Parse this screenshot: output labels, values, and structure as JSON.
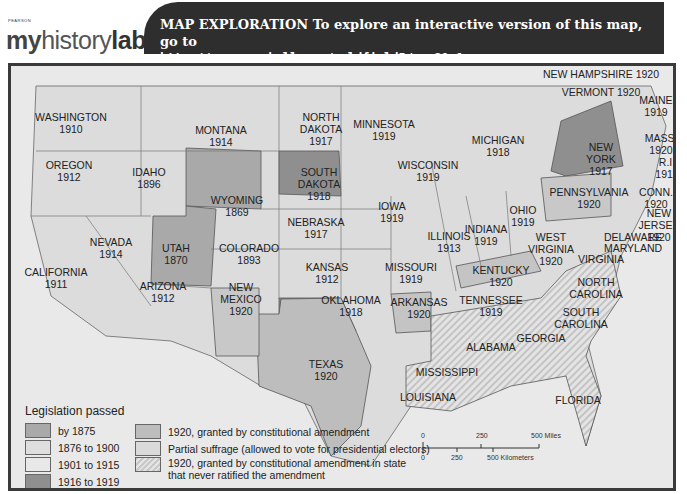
{
  "header": {
    "publisher": "PEARSON",
    "logo_text": [
      "my",
      "history",
      "lab"
    ],
    "banner_line1": "MAP EXPLORATION  To explore an interactive version of this map, go to",
    "banner_line2": "http://www.prenhall.com/goldfield5/map21.1"
  },
  "colors": {
    "by_1875": "#a9a9a9",
    "1876_1900": "#e0e0e0",
    "1901_1915": "#e6e6e6",
    "1916_1919": "#8f8f8f",
    "amendment_1920": "#bdbdbd",
    "partial": "#dadada",
    "water": "#ececec",
    "banner": "#2e2e2e"
  },
  "states": [
    {
      "name": "WASHINGTON",
      "year": "1910",
      "x": 60,
      "y": 55
    },
    {
      "name": "OREGON",
      "year": "1912",
      "x": 58,
      "y": 103
    },
    {
      "name": "IDAHO",
      "year": "1896",
      "x": 138,
      "y": 110
    },
    {
      "name": "MONTANA",
      "year": "1914",
      "x": 210,
      "y": 68
    },
    {
      "name": "WYOMING",
      "year": "1869",
      "x": 226,
      "y": 138
    },
    {
      "name": "NORTH DAKOTA",
      "year": "1917",
      "x": 310,
      "y": 55
    },
    {
      "name": "SOUTH DAKOTA",
      "year": "1918",
      "x": 308,
      "y": 110
    },
    {
      "name": "MINNESOTA",
      "year": "1919",
      "x": 373,
      "y": 62
    },
    {
      "name": "WISCONSIN",
      "year": "1919",
      "x": 417,
      "y": 103
    },
    {
      "name": "MICHIGAN",
      "year": "1918",
      "x": 487,
      "y": 78
    },
    {
      "name": "NEVADA",
      "year": "1914",
      "x": 100,
      "y": 180
    },
    {
      "name": "CALIFORNIA",
      "year": "1911",
      "x": 45,
      "y": 210
    },
    {
      "name": "UTAH",
      "year": "1870",
      "x": 165,
      "y": 186
    },
    {
      "name": "COLORADO",
      "year": "1893",
      "x": 238,
      "y": 186
    },
    {
      "name": "NEBRASKA",
      "year": "1917",
      "x": 305,
      "y": 160
    },
    {
      "name": "IOWA",
      "year": "1919",
      "x": 381,
      "y": 144
    },
    {
      "name": "KANSAS",
      "year": "1912",
      "x": 316,
      "y": 205
    },
    {
      "name": "MISSOURI",
      "year": "1919",
      "x": 400,
      "y": 205
    },
    {
      "name": "ILLINOIS",
      "year": "1913",
      "x": 438,
      "y": 174
    },
    {
      "name": "INDIANA",
      "year": "1919",
      "x": 475,
      "y": 167
    },
    {
      "name": "OHIO",
      "year": "1919",
      "x": 512,
      "y": 148
    },
    {
      "name": "ARIZONA",
      "year": "1912",
      "x": 152,
      "y": 224
    },
    {
      "name": "NEW MEXICO",
      "year": "1920",
      "x": 230,
      "y": 225
    },
    {
      "name": "OKLAHOMA",
      "year": "1918",
      "x": 340,
      "y": 238
    },
    {
      "name": "TEXAS",
      "year": "1920",
      "x": 315,
      "y": 302
    },
    {
      "name": "ARKANSAS",
      "year": "1920",
      "x": 408,
      "y": 240
    },
    {
      "name": "KENTUCKY",
      "year": "1920",
      "x": 490,
      "y": 208
    },
    {
      "name": "TENNESSEE",
      "year": "1919",
      "x": 480,
      "y": 238
    },
    {
      "name": "WEST VIRGINIA",
      "year": "1920",
      "x": 540,
      "y": 175
    },
    {
      "name": "VIRGINIA",
      "year": "",
      "x": 590,
      "y": 197
    },
    {
      "name": "NORTH CAROLINA",
      "year": "",
      "x": 585,
      "y": 220
    },
    {
      "name": "SOUTH CAROLINA",
      "year": "",
      "x": 570,
      "y": 250
    },
    {
      "name": "GEORGIA",
      "year": "",
      "x": 530,
      "y": 276
    },
    {
      "name": "ALABAMA",
      "year": "",
      "x": 480,
      "y": 285
    },
    {
      "name": "MISSISSIPPI",
      "year": "",
      "x": 436,
      "y": 310
    },
    {
      "name": "LOUISIANA",
      "year": "",
      "x": 417,
      "y": 335
    },
    {
      "name": "FLORIDA",
      "year": "",
      "x": 567,
      "y": 338
    },
    {
      "name": "PENNSYLVANIA",
      "year": "1920",
      "x": 578,
      "y": 130
    },
    {
      "name": "NEW YORK",
      "year": "1917",
      "x": 590,
      "y": 85
    },
    {
      "name": "MAINE",
      "year": "1919",
      "x": 645,
      "y": 38
    },
    {
      "name": "MASS.",
      "year": "1920",
      "x": 650,
      "y": 76
    },
    {
      "name": "R.I.",
      "year": "1917",
      "x": 656,
      "y": 100
    },
    {
      "name": "CONN.",
      "year": "1920",
      "x": 645,
      "y": 130
    },
    {
      "name": "NEW JERSEY",
      "year": "1920",
      "x": 648,
      "y": 151
    },
    {
      "name": "NEW HAMPSHIRE 1920",
      "year": "",
      "x": 590,
      "y": 12
    },
    {
      "name": "VERMONT 1920",
      "year": "",
      "x": 590,
      "y": 30
    },
    {
      "name": "DELAWARE",
      "year": "",
      "x": 622,
      "y": 175
    },
    {
      "name": "MARYLAND",
      "year": "",
      "x": 622,
      "y": 186
    }
  ],
  "legend": {
    "title": "Legislation passed",
    "left": [
      "by 1875",
      "1876 to 1900",
      "1901 to 1915",
      "1916 to 1919"
    ],
    "right": [
      "1920, granted by constitutional amendment",
      "Partial suffrage (allowed to vote for presidential electors)",
      "1920, granted by constitutional amendment in state",
      "that never ratified the amendment"
    ]
  },
  "scale": {
    "miles": [
      "0",
      "250",
      "500 Miles"
    ],
    "km": [
      "0",
      "250",
      "500 Kilometers"
    ]
  }
}
